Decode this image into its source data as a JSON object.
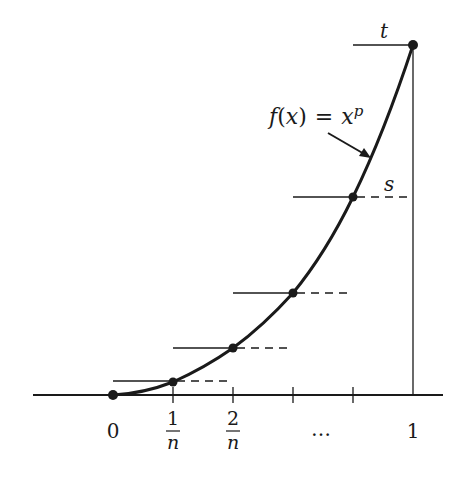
{
  "diagram": {
    "function_label": {
      "f": "f",
      "open": "(",
      "x": "x",
      "close": ")",
      "eq": "=",
      "base": "x",
      "exp": "p"
    },
    "top_label": "t",
    "step_label": "s",
    "x_axis": {
      "tick_labels": [
        {
          "num": "0",
          "den": ""
        },
        {
          "num": "1",
          "den": "n"
        },
        {
          "num": "2",
          "den": "n"
        },
        {
          "num": "…",
          "den": ""
        },
        {
          "num": "1",
          "den": ""
        }
      ]
    },
    "points": [
      {
        "x": "0",
        "y": "0"
      },
      {
        "x": "1/n",
        "y": "(1/n)^p"
      },
      {
        "x": "2/n",
        "y": "(2/n)^p"
      },
      {
        "x": "3/n",
        "y": "(3/n)^p"
      },
      {
        "x": "4/n",
        "y": "(4/n)^p"
      },
      {
        "x": "1",
        "y": "1"
      }
    ],
    "colors": {
      "ink": "#1a1a1a",
      "background": "#ffffff"
    }
  }
}
